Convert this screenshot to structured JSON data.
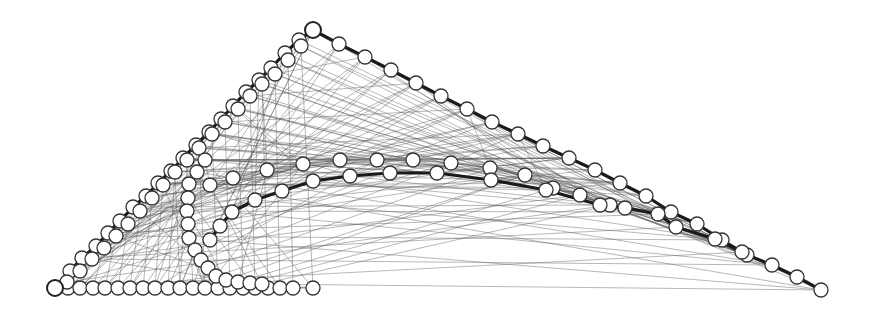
{
  "diagram": {
    "type": "graph-embedding",
    "background": "#ffffff",
    "node_fill": "#ffffff",
    "node_stroke": "#333333",
    "thick_edge_color": "#1a1a1a",
    "thin_edge_color": "#555555",
    "node_radius": 7,
    "chains": [
      {
        "name": "bottom-row",
        "thick": false,
        "nodes": [
          [
            55,
            288
          ],
          [
            68,
            288
          ],
          [
            80,
            288
          ],
          [
            93,
            288
          ],
          [
            105,
            288
          ],
          [
            118,
            288
          ],
          [
            130,
            288
          ],
          [
            143,
            288
          ],
          [
            155,
            288
          ],
          [
            168,
            288
          ],
          [
            180,
            288
          ],
          [
            193,
            288
          ],
          [
            205,
            288
          ],
          [
            218,
            288
          ],
          [
            230,
            288
          ],
          [
            243,
            288
          ],
          [
            255,
            288
          ],
          [
            268,
            288
          ],
          [
            280,
            288
          ],
          [
            293,
            288
          ],
          [
            313,
            288
          ]
        ]
      },
      {
        "name": "outer-left-edge",
        "thick": true,
        "nodes": [
          [
            55,
            288
          ],
          [
            70,
            271
          ],
          [
            82,
            258
          ],
          [
            96,
            246
          ],
          [
            108,
            233
          ],
          [
            120,
            221
          ],
          [
            133,
            207
          ],
          [
            146,
            196
          ],
          [
            158,
            183
          ],
          [
            171,
            171
          ],
          [
            183,
            158
          ],
          [
            196,
            145
          ],
          [
            209,
            132
          ],
          [
            221,
            119
          ],
          [
            233,
            106
          ],
          [
            246,
            92
          ],
          [
            259,
            80
          ],
          [
            271,
            68
          ],
          [
            285,
            53
          ],
          [
            299,
            40
          ],
          [
            313,
            30
          ]
        ]
      },
      {
        "name": "top-right-edge",
        "thick": true,
        "nodes": [
          [
            313,
            30
          ],
          [
            339,
            44
          ],
          [
            365,
            57
          ],
          [
            391,
            70
          ],
          [
            416,
            83
          ],
          [
            441,
            96
          ],
          [
            467,
            109
          ],
          [
            492,
            122
          ],
          [
            518,
            134
          ],
          [
            543,
            146
          ],
          [
            569,
            158
          ],
          [
            595,
            170
          ],
          [
            620,
            183
          ],
          [
            646,
            196
          ],
          [
            671,
            212
          ],
          [
            697,
            224
          ],
          [
            722,
            240
          ],
          [
            747,
            255
          ],
          [
            772,
            265
          ],
          [
            797,
            277
          ],
          [
            821,
            290
          ]
        ]
      },
      {
        "name": "inner-left-edge",
        "thick": false,
        "nodes": [
          [
            67,
            282
          ],
          [
            80,
            271
          ],
          [
            92,
            259
          ],
          [
            104,
            248
          ],
          [
            116,
            236
          ],
          [
            128,
            224
          ],
          [
            140,
            211
          ],
          [
            152,
            198
          ],
          [
            163,
            185
          ],
          [
            175,
            172
          ],
          [
            187,
            160
          ],
          [
            199,
            148
          ],
          [
            212,
            134
          ],
          [
            225,
            122
          ],
          [
            238,
            109
          ],
          [
            250,
            96
          ],
          [
            262,
            84
          ],
          [
            275,
            74
          ],
          [
            288,
            60
          ],
          [
            301,
            46
          ]
        ]
      },
      {
        "name": "inner-vertical-chain",
        "thick": false,
        "nodes": [
          [
            205,
            160
          ],
          [
            197,
            172
          ],
          [
            189,
            184
          ],
          [
            188,
            198
          ],
          [
            187,
            211
          ],
          [
            188,
            224
          ],
          [
            189,
            238
          ],
          [
            195,
            250
          ],
          [
            201,
            260
          ],
          [
            208,
            268
          ],
          [
            216,
            276
          ],
          [
            226,
            280
          ],
          [
            238,
            282
          ],
          [
            250,
            283
          ],
          [
            262,
            284
          ]
        ]
      },
      {
        "name": "middle-arc",
        "thick": false,
        "nodes": [
          [
            210,
            185
          ],
          [
            233,
            178
          ],
          [
            267,
            170
          ],
          [
            303,
            164
          ],
          [
            340,
            160
          ],
          [
            377,
            160
          ],
          [
            413,
            160
          ],
          [
            451,
            163
          ],
          [
            490,
            168
          ],
          [
            525,
            175
          ],
          [
            553,
            188
          ],
          [
            580,
            195
          ],
          [
            610,
            205
          ]
        ]
      },
      {
        "name": "lower-arc",
        "thick": true,
        "nodes": [
          [
            210,
            240
          ],
          [
            220,
            226
          ],
          [
            232,
            212
          ],
          [
            255,
            200
          ],
          [
            282,
            191
          ],
          [
            313,
            181
          ],
          [
            350,
            176
          ],
          [
            390,
            173
          ],
          [
            437,
            173
          ],
          [
            491,
            180
          ],
          [
            546,
            190
          ],
          [
            600,
            205
          ],
          [
            625,
            208
          ],
          [
            658,
            214
          ],
          [
            676,
            227
          ],
          [
            715,
            239
          ],
          [
            742,
            252
          ]
        ]
      }
    ],
    "apex_node": [
      313,
      30
    ],
    "origin_node": [
      55,
      288
    ]
  }
}
